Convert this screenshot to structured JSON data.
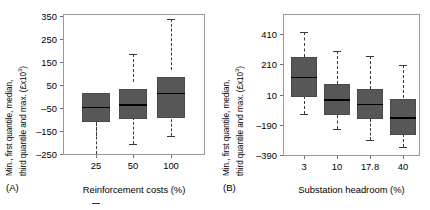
{
  "figure": {
    "panels": [
      {
        "id": "A",
        "tag": "(A)",
        "ylabel_line1": "Min., first quantile, median,",
        "ylabel_line2": "third quantile and max. (£x10",
        "ylabel_sup": "3",
        "ylabel_close": ")",
        "xlabel": "Reinforcement costs (%)",
        "yticks": [
          "350",
          "250",
          "150",
          "50",
          "–50",
          "–150",
          "–250"
        ],
        "ytick_values": [
          350,
          250,
          150,
          50,
          -50,
          -150,
          -250
        ],
        "ylim": [
          -250,
          350
        ],
        "categories": [
          "25",
          "50",
          "100"
        ]
      },
      {
        "id": "B",
        "tag": "(B)",
        "ylabel_line1": "Min., first quantile, median,",
        "ylabel_line2": "third quantile and max. (£x10",
        "ylabel_sup": "3",
        "ylabel_close": ")",
        "xlabel": "Substation headroom (%)",
        "yticks": [
          "410",
          "210",
          "10",
          "–190",
          "–390"
        ],
        "ytick_values": [
          410,
          210,
          10,
          -190,
          -390
        ],
        "ylim": [
          -390,
          610
        ],
        "categories": [
          "3",
          "10",
          "17.8",
          "40"
        ]
      }
    ]
  },
  "chart_data": [
    {
      "type": "box",
      "panel": "A",
      "title": "",
      "xlabel": "Reinforcement costs (%)",
      "ylabel": "Min., first quantile, median, third quantile and max. (£x10³)",
      "categories": [
        "25",
        "50",
        "100"
      ],
      "ylim": [
        -250,
        350
      ],
      "yticks": [
        350,
        250,
        150,
        50,
        -50,
        -150,
        -250
      ],
      "grid": false,
      "legend": "none",
      "boxes": [
        {
          "category": "25",
          "min": -212,
          "q1": -108,
          "median": -47,
          "q3": 18,
          "max": 157
        },
        {
          "category": "50",
          "min": -207,
          "q1": -90,
          "median": -8,
          "q3": 58,
          "max": 180
        },
        {
          "category": "100",
          "min": -172,
          "q1": -63,
          "median": 40,
          "q3": 112,
          "max": 330
        }
      ]
    },
    {
      "type": "box",
      "panel": "B",
      "title": "",
      "xlabel": "Substation headroom (%)",
      "ylabel": "Min., first quantile, median, third quantile and max. (£x10³)",
      "categories": [
        "3",
        "10",
        "17.8",
        "40"
      ],
      "ylim": [
        -390,
        610
      ],
      "yticks": [
        410,
        210,
        10,
        -190,
        -390
      ],
      "grid": false,
      "legend": "none",
      "boxes": [
        {
          "category": "3",
          "min": -100,
          "q1": -16,
          "median": 120,
          "q3": 280,
          "max": 560
        },
        {
          "category": "10",
          "min": -165,
          "q1": -126,
          "median": -20,
          "q3": 77,
          "max": 320
        },
        {
          "category": "17.8",
          "min": -235,
          "q1": -152,
          "median": -10,
          "q3": 45,
          "max": 290
        },
        {
          "category": "40",
          "min": -320,
          "q1": -250,
          "median": -110,
          "q3": 10,
          "max": 230
        }
      ]
    }
  ]
}
